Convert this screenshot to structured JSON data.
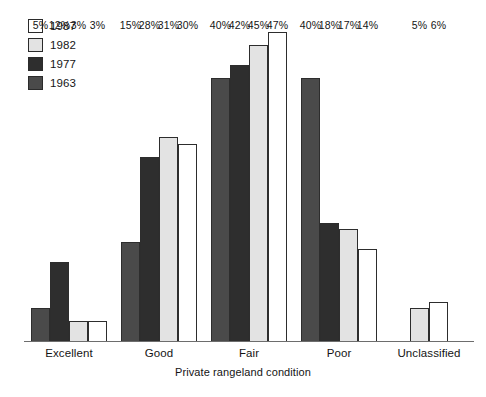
{
  "chart_data": {
    "type": "bar",
    "title": "",
    "xlabel": "Private rangeland condition",
    "ylabel": "",
    "ylim": [
      0,
      47
    ],
    "grid": false,
    "legend_position": "top-left",
    "value_suffix": "%",
    "categories": [
      "Excellent",
      "Good",
      "Fair",
      "Poor",
      "Unclassified"
    ],
    "series": [
      {
        "name": "1963",
        "color": "#4a4a4a",
        "values": [
          5,
          15,
          40,
          40,
          null
        ],
        "labels": [
          "5%",
          "15%",
          "40%",
          "40%",
          ""
        ]
      },
      {
        "name": "1977",
        "color": "#2e2e2e",
        "values": [
          12,
          28,
          42,
          18,
          null
        ],
        "labels": [
          "12%",
          "28%",
          "42%",
          "18%",
          ""
        ]
      },
      {
        "name": "1982",
        "color": "#e3e3e3",
        "values": [
          3,
          31,
          45,
          17,
          5
        ],
        "labels": [
          "3%",
          "31%",
          "45%",
          "17%",
          "5%"
        ]
      },
      {
        "name": "1987",
        "color": "#ffffff",
        "values": [
          3,
          30,
          47,
          14,
          6
        ],
        "labels": [
          "3%",
          "30%",
          "47%",
          "14%",
          "6%"
        ]
      }
    ]
  },
  "legend": {
    "items": [
      {
        "label": "1987",
        "color": "#ffffff"
      },
      {
        "label": "1982",
        "color": "#e3e3e3"
      },
      {
        "label": "1977",
        "color": "#2e2e2e"
      },
      {
        "label": "1963",
        "color": "#4a4a4a"
      }
    ]
  },
  "axis": {
    "xlabel": "Private rangeland condition"
  }
}
